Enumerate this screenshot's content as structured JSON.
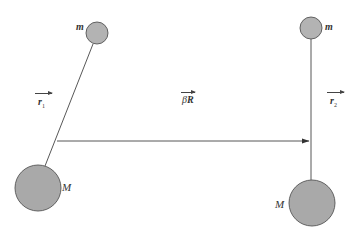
{
  "diagram": {
    "type": "two pendulum-like mass systems connected by displacement vector",
    "colors": {
      "background": "#ffffff",
      "mass_fill": "#b3b3b3",
      "mass_stroke": "#555555",
      "line": "#444444",
      "text": "#333333"
    },
    "left_system": {
      "small_mass": {
        "label": "m",
        "cx": 97,
        "cy": 33,
        "r": 11
      },
      "large_mass": {
        "label": "M",
        "cx": 38,
        "cy": 188,
        "r": 23
      },
      "rod": {
        "x1": 93,
        "y1": 44,
        "x2": 45,
        "y2": 165
      },
      "vector_label": {
        "symbol": "r",
        "subscript": "1"
      }
    },
    "right_system": {
      "small_mass": {
        "label": "m",
        "cx": 311,
        "cy": 28,
        "r": 11
      },
      "large_mass": {
        "label": "M",
        "cx": 312,
        "cy": 203,
        "r": 23
      },
      "rod": {
        "x1": 311,
        "y1": 39,
        "x2": 311,
        "y2": 180
      },
      "vector_label": {
        "symbol": "r",
        "subscript": "2"
      }
    },
    "displacement_vector": {
      "label_prefix": "β",
      "label_symbol": "R",
      "x1": 57,
      "y1": 141,
      "x2": 309,
      "y2": 141
    }
  }
}
